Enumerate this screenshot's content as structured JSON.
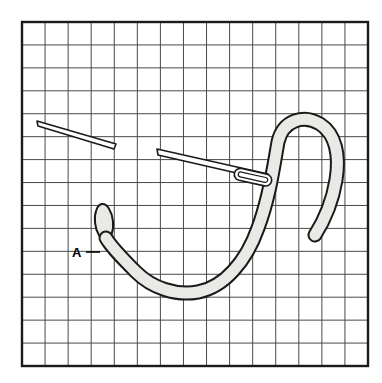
{
  "figure": {
    "kind": "line-drawing",
    "background_color": "#ffffff"
  },
  "grid": {
    "name": "graph-paper-grid",
    "origin_x": 22,
    "origin_y": 22,
    "width": 346,
    "height": 344,
    "columns": 15,
    "rows": 15,
    "cell_size": 23,
    "line_color": "#4a4a4a",
    "line_width": 1,
    "border_color": "#1a1a1a",
    "border_width": 2.4
  },
  "thread": {
    "name": "embroidery-thread",
    "fill_color": "#e9e9e6",
    "outline_color": "#1a1a1a",
    "outline_width": 2,
    "band_width": 11,
    "description": "Loop of thread curving from point A down through a U and up into a hooked arch at right"
  },
  "anchor_stub": {
    "name": "thread-anchor-stub",
    "center_x": 104,
    "center_y": 222,
    "rx": 9,
    "ry": 18,
    "fill_color": "#e9e9e6",
    "outline_color": "#1a1a1a"
  },
  "needles": [
    {
      "name": "upper-needle",
      "tip_x": 37,
      "tip_y": 122,
      "end_x": 115,
      "end_y": 147,
      "fill_color": "#ffffff",
      "outline_color": "#1a1a1a"
    },
    {
      "name": "lower-needle",
      "tip_x": 157,
      "tip_y": 150,
      "end_x": 272,
      "end_y": 181,
      "fill_color": "#ffffff",
      "outline_color": "#1a1a1a",
      "eye": {
        "name": "needle-eye",
        "x": 234,
        "y": 172,
        "length": 36,
        "height": 11
      }
    }
  ],
  "labels": [
    {
      "name": "point-label-a",
      "text": "A",
      "x": 78,
      "y": 256,
      "leader_x1": 87,
      "leader_y1": 252,
      "leader_x2": 100,
      "leader_y2": 252,
      "color": "#000000"
    }
  ]
}
